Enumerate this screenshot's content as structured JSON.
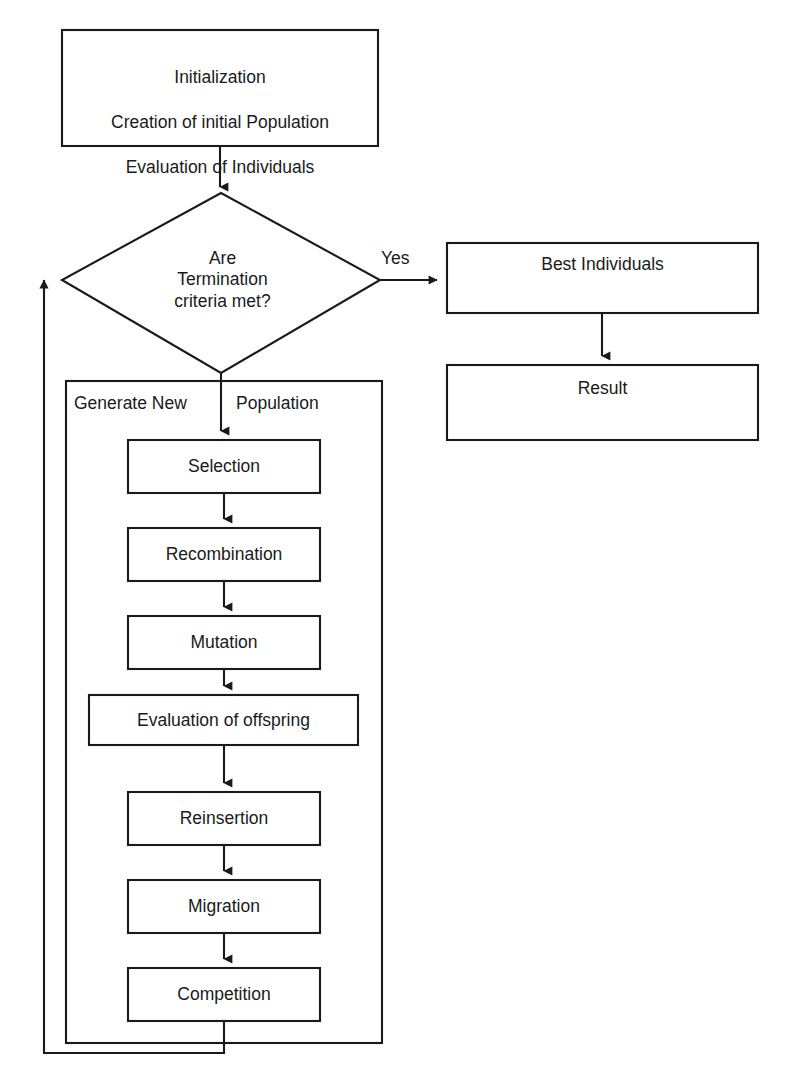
{
  "diagram": {
    "type": "flowchart",
    "background_color": "#ffffff",
    "stroke_color": "#1a1a1a",
    "nodes": {
      "initialization": {
        "shape": "rectangle",
        "line1": "Initialization",
        "line2": "Creation of initial Population",
        "line3": "Evaluation of Individuals"
      },
      "decision": {
        "shape": "diamond",
        "line1": "Are",
        "line2": "Termination",
        "line3": "criteria met?"
      },
      "best_individuals": {
        "shape": "rectangle",
        "label": "Best Individuals"
      },
      "result": {
        "shape": "rectangle",
        "label": "Result"
      },
      "generate_new_population": {
        "shape": "container",
        "label_left": "Generate New",
        "label_right": "Population"
      },
      "steps": [
        {
          "id": "selection",
          "label": "Selection"
        },
        {
          "id": "recombination",
          "label": "Recombination"
        },
        {
          "id": "mutation",
          "label": "Mutation"
        },
        {
          "id": "evaluation_of_offspring",
          "label": "Evaluation of offspring"
        },
        {
          "id": "reinsertion",
          "label": "Reinsertion"
        },
        {
          "id": "migration",
          "label": "Migration"
        },
        {
          "id": "competition",
          "label": "Competition"
        }
      ]
    },
    "edges": {
      "yes_label": "Yes"
    }
  }
}
